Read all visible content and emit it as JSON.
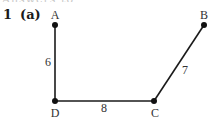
{
  "header": {
    "cut_text": "Answers to exercises",
    "question_number": "1",
    "part_label": "(a)"
  },
  "diagram": {
    "line_color": "#1a1a1a",
    "vertices": {
      "A": {
        "label": "A",
        "x": 55,
        "y": 25
      },
      "B": {
        "label": "B",
        "x": 204,
        "y": 25
      },
      "C": {
        "label": "C",
        "x": 154,
        "y": 101
      },
      "D": {
        "label": "D",
        "x": 55,
        "y": 101
      }
    },
    "edges": [
      {
        "from": "A",
        "to": "D",
        "weight": "6"
      },
      {
        "from": "D",
        "to": "C",
        "weight": "8"
      },
      {
        "from": "C",
        "to": "B",
        "weight": "7"
      }
    ]
  }
}
